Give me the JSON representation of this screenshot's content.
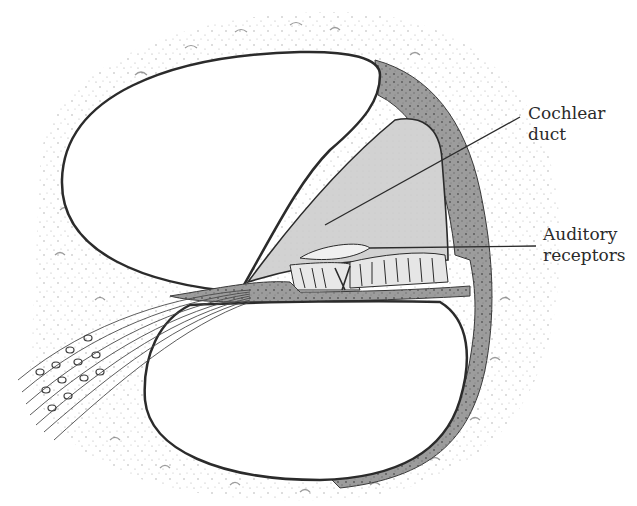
{
  "figure": {
    "colors": {
      "background": "#ffffff",
      "bone_wall": "#9a9a9a",
      "bone_wall_dark": "#5e5e5e",
      "duct_fill": "#cfcfcf",
      "outline": "#2b2b2b",
      "stipple": "#8a8a8a",
      "label_text": "#2a2a2a"
    }
  },
  "labels": [
    {
      "id": "cochlear-duct",
      "lines": [
        "Cochlear",
        "duct"
      ]
    },
    {
      "id": "auditory-receptors",
      "lines": [
        "Auditory",
        "receptors"
      ]
    }
  ]
}
